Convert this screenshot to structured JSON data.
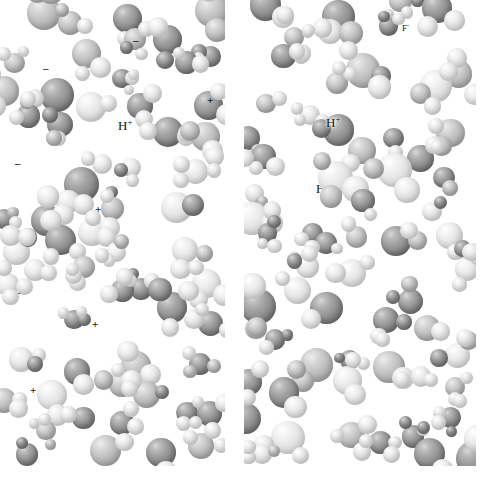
{
  "figure": {
    "type": "space-filling-molecular-model",
    "background_color": "#ffffff",
    "panel_count": 2,
    "width": 480,
    "height": 478
  },
  "palette": {
    "oxygen_sphere": "#8e8e8e",
    "hydrogen_sphere": "#e0e0e0",
    "halide_sphere": "#a0a0a0",
    "label_color": "#111111",
    "background": "#ffffff"
  },
  "panels": [
    {
      "id": "panel-left",
      "name": "hydrochloric-acid-panel",
      "system": "HCl",
      "bounds": {
        "x": 0,
        "y": 0,
        "width": 225,
        "height": 466
      },
      "labels": [
        {
          "text": "H",
          "charge": "+",
          "x": 118,
          "y": 118,
          "size": "sp"
        },
        {
          "text": "Cl",
          "charge": "-",
          "x": 178,
          "y": 243,
          "size": "sp"
        }
      ],
      "charge_marks": [
        {
          "sign": "-",
          "x": 43,
          "y": 63
        },
        {
          "sign": "-",
          "x": 133,
          "y": 35
        },
        {
          "sign": "+",
          "x": 207,
          "y": 95
        },
        {
          "sign": "-",
          "x": 15,
          "y": 158
        },
        {
          "sign": "+",
          "x": 95,
          "y": 204
        },
        {
          "sign": "-",
          "x": 16,
          "y": 287
        },
        {
          "sign": "+",
          "x": 92,
          "y": 319
        },
        {
          "sign": "+",
          "x": 30,
          "y": 385
        },
        {
          "sign": "+",
          "x": 189,
          "y": 399
        },
        {
          "sign": "-",
          "x": 93,
          "y": 444
        }
      ]
    },
    {
      "id": "panel-right",
      "name": "hydrofluoric-acid-panel",
      "system": "HF",
      "bounds": {
        "x": 244,
        "y": 0,
        "width": 232,
        "height": 466
      },
      "labels": [
        {
          "text": "F",
          "charge": "-",
          "x": 158,
          "y": 22,
          "size": "sm"
        },
        {
          "text": "H",
          "charge": "+",
          "x": 82,
          "y": 115,
          "size": "sp"
        },
        {
          "text": "HF",
          "charge": "",
          "x": 72,
          "y": 182,
          "size": "sp"
        }
      ],
      "charge_marks": []
    }
  ],
  "species_legend": [
    {
      "symbol": "H",
      "charge": "+",
      "name": "hydronium-proton"
    },
    {
      "symbol": "Cl",
      "charge": "-",
      "name": "chloride-ion"
    },
    {
      "symbol": "F",
      "charge": "-",
      "name": "fluoride-ion"
    },
    {
      "symbol": "HF",
      "charge": "",
      "name": "hydrogen-fluoride-molecule"
    }
  ]
}
